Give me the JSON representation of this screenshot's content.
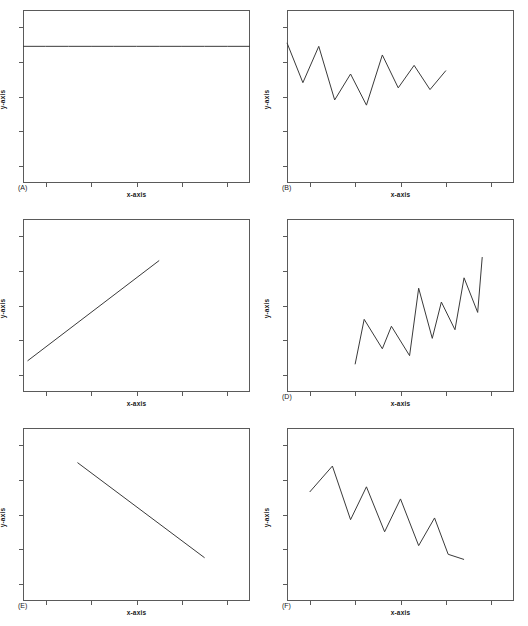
{
  "figure": {
    "axis_labels": {
      "x": "x-axis",
      "y": "y-axis"
    },
    "line_color": "#3a3a3a",
    "frame_color": "#5a5a5a",
    "background": "#ffffff"
  },
  "chart_data": [
    {
      "type": "line",
      "panel": "(A)",
      "title": "",
      "xlabel": "x-axis",
      "ylabel": "y-axis",
      "xlim": [
        0,
        100
      ],
      "ylim": [
        0,
        100
      ],
      "grid": false,
      "legend": null,
      "description": "flat horizontal line, no trend, no variability",
      "x": [
        0,
        10,
        20,
        30,
        40,
        50,
        60,
        70,
        80,
        90,
        100
      ],
      "values": [
        79,
        79,
        79,
        79,
        79,
        79,
        79,
        79,
        79,
        79,
        79
      ]
    },
    {
      "type": "line",
      "panel": "(B)",
      "title": "",
      "xlabel": "x-axis",
      "ylabel": "y-axis",
      "xlim": [
        0,
        100
      ],
      "ylim": [
        0,
        100
      ],
      "grid": false,
      "legend": null,
      "description": "high variability, no overall trend",
      "x": [
        0,
        7,
        14,
        21,
        28,
        35,
        42,
        49,
        56,
        63,
        70
      ],
      "values": [
        81,
        58,
        79,
        48,
        63,
        45,
        74,
        55,
        68,
        54,
        65
      ]
    },
    {
      "type": "line",
      "panel": "",
      "title": "",
      "xlabel": "x-axis",
      "ylabel": "y-axis",
      "xlim": [
        0,
        100
      ],
      "ylim": [
        0,
        100
      ],
      "grid": false,
      "legend": null,
      "description": "steady increasing straight line, no variability",
      "x": [
        2,
        60
      ],
      "values": [
        18,
        76
      ]
    },
    {
      "type": "line",
      "panel": "(D)",
      "title": "",
      "xlabel": "x-axis",
      "ylabel": "y-axis",
      "xlim": [
        0,
        100
      ],
      "ylim": [
        0,
        100
      ],
      "grid": false,
      "legend": null,
      "description": "rising sawtooth, increasing trend with variability",
      "x": [
        30,
        34,
        42,
        46,
        54,
        58,
        64,
        68,
        74,
        78,
        84,
        86
      ],
      "values": [
        16,
        42,
        25,
        38,
        21,
        60,
        31,
        52,
        36,
        66,
        46,
        78
      ]
    },
    {
      "type": "line",
      "panel": "(E)",
      "title": "",
      "xlabel": "x-axis",
      "ylabel": "y-axis",
      "xlim": [
        0,
        100
      ],
      "ylim": [
        0,
        100
      ],
      "grid": false,
      "legend": null,
      "description": "steady decreasing straight line, no variability",
      "x": [
        24,
        80
      ],
      "values": [
        80,
        25
      ]
    },
    {
      "type": "line",
      "panel": "(F)",
      "title": "",
      "xlabel": "x-axis",
      "ylabel": "y-axis",
      "xlim": [
        0,
        100
      ],
      "ylim": [
        0,
        100
      ],
      "grid": false,
      "legend": null,
      "description": "decreasing trend with high variability",
      "x": [
        10,
        20,
        28,
        35,
        43,
        50,
        58,
        65,
        71,
        78
      ],
      "values": [
        63,
        78,
        47,
        66,
        40,
        59,
        32,
        48,
        27,
        24
      ]
    }
  ]
}
